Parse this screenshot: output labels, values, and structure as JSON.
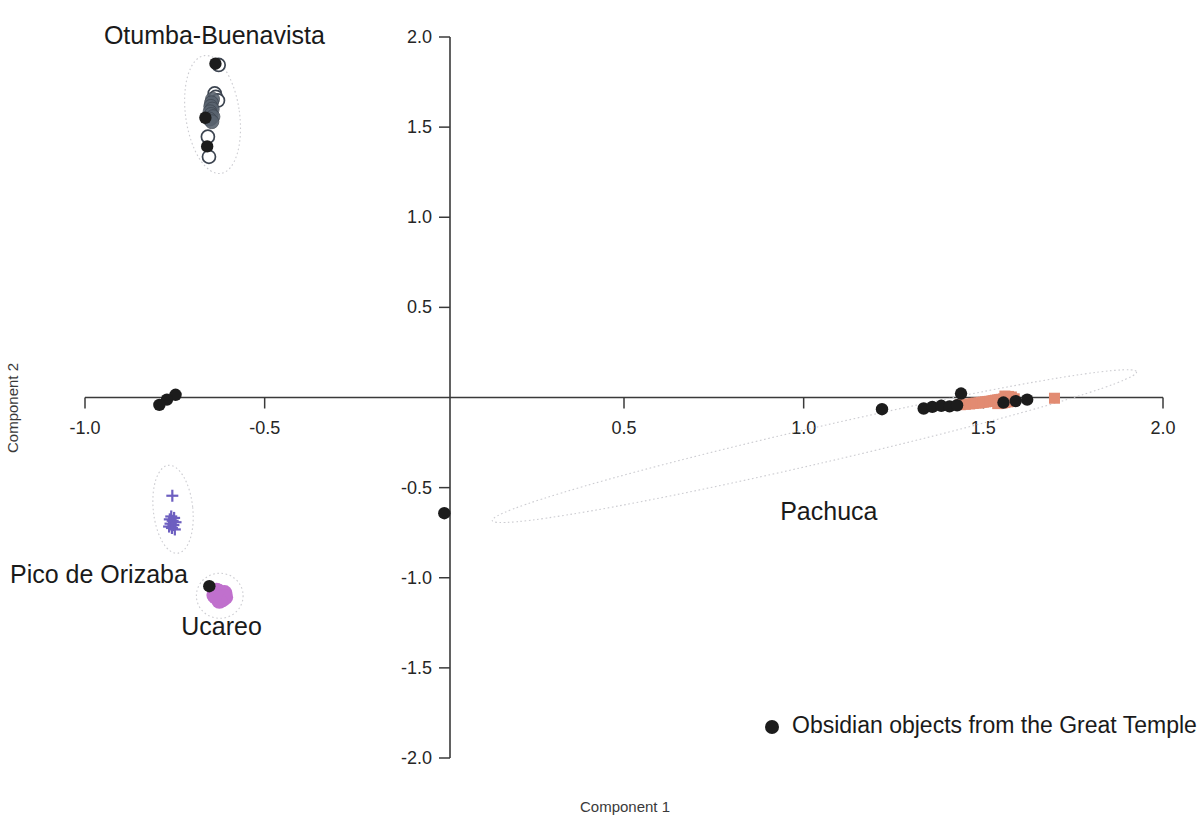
{
  "chart_data": {
    "type": "scatter",
    "title": "",
    "xlabel": "Component 1",
    "ylabel": "Component 2",
    "xlim": [
      -1.0,
      2.0
    ],
    "ylim": [
      -2.0,
      2.0
    ],
    "xticks": [
      "-1.0",
      "-0.5",
      "0.5",
      "1.0",
      "1.5",
      "2.0"
    ],
    "xtick_values": [
      -1.0,
      -0.5,
      0.5,
      1.0,
      1.5,
      2.0
    ],
    "yticks": [
      "2.0",
      "1.5",
      "1.0",
      "0.5",
      "-0.5",
      "-1.0",
      "-1.5",
      "-2.0"
    ],
    "ytick_values": [
      2.0,
      1.5,
      1.0,
      0.5,
      -0.5,
      -1.0,
      -1.5,
      -2.0
    ],
    "grid": false,
    "legend_position": "bottom-right",
    "legend": [
      {
        "marker": "filled-circle",
        "color": "#1c1c1c",
        "label": "Obsidian objects from the Great Temple"
      }
    ],
    "cluster_labels": [
      {
        "name": "Otumba-Buenavista",
        "x": -0.64,
        "y": 1.96
      },
      {
        "name": "Pachuca",
        "x": 1.07,
        "y": -0.68
      },
      {
        "name": "Pico de Orizaba",
        "x": -0.99,
        "y": -1.03
      },
      {
        "name": "Ucareo",
        "x": -0.62,
        "y": -1.32
      }
    ],
    "confidence_ellipses": [
      {
        "group": "Otumba-Buenavista",
        "cx": -0.645,
        "cy": 1.57,
        "rx": 0.075,
        "ry": 0.33,
        "angle": -8
      },
      {
        "group": "Pico de Orizaba",
        "cx": -0.755,
        "cy": -0.62,
        "rx": 0.055,
        "ry": 0.245,
        "angle": -6
      },
      {
        "group": "Ucareo",
        "cx": -0.625,
        "cy": -1.1,
        "rx": 0.065,
        "ry": 0.125,
        "angle": 0
      },
      {
        "group": "Pachuca",
        "cx": 1.03,
        "cy": -0.27,
        "rx": 0.92,
        "ry": 0.1,
        "angle": -13
      }
    ],
    "series": [
      {
        "name": "Otumba-Buenavista reference",
        "marker": "open-circle",
        "color": "#3c4450",
        "points": [
          {
            "x": -0.628,
            "y": 1.845
          },
          {
            "x": -0.639,
            "y": 1.687
          },
          {
            "x": -0.636,
            "y": 1.668
          },
          {
            "x": -0.63,
            "y": 1.648
          },
          {
            "x": -0.652,
            "y": 1.545
          },
          {
            "x": -0.658,
            "y": 1.447
          },
          {
            "x": -0.655,
            "y": 1.335
          }
        ]
      },
      {
        "name": "Otumba-Buenavista core",
        "marker": "filled-slate",
        "color": "#59636f",
        "points": [
          {
            "x": -0.645,
            "y": 1.655
          },
          {
            "x": -0.648,
            "y": 1.635
          },
          {
            "x": -0.65,
            "y": 1.615
          },
          {
            "x": -0.646,
            "y": 1.6
          },
          {
            "x": -0.652,
            "y": 1.585
          },
          {
            "x": -0.649,
            "y": 1.57
          },
          {
            "x": -0.644,
            "y": 1.558
          },
          {
            "x": -0.654,
            "y": 1.545
          },
          {
            "x": -0.647,
            "y": 1.53
          }
        ]
      },
      {
        "name": "Obsidian objects from the Great Temple",
        "marker": "filled-circle",
        "color": "#1c1c1c",
        "points": [
          {
            "x": -0.637,
            "y": 1.852
          },
          {
            "x": -0.665,
            "y": 1.552
          },
          {
            "x": -0.66,
            "y": 1.393
          },
          {
            "x": -0.748,
            "y": 0.015
          },
          {
            "x": -0.772,
            "y": -0.012
          },
          {
            "x": -0.793,
            "y": -0.041
          },
          {
            "x": -0.654,
            "y": -1.047
          },
          {
            "x": 0.0,
            "y": -0.642
          },
          {
            "x": 1.218,
            "y": -0.065
          },
          {
            "x": 1.334,
            "y": -0.061
          },
          {
            "x": 1.358,
            "y": -0.052
          },
          {
            "x": 1.383,
            "y": -0.046
          },
          {
            "x": 1.406,
            "y": -0.049
          },
          {
            "x": 1.427,
            "y": -0.043
          },
          {
            "x": 1.438,
            "y": 0.022
          },
          {
            "x": 1.556,
            "y": -0.028
          },
          {
            "x": 1.59,
            "y": -0.02
          },
          {
            "x": 1.622,
            "y": -0.012
          }
        ]
      },
      {
        "name": "Pachuca reference",
        "marker": "filled-square",
        "color": "#e28b72",
        "points": [
          {
            "x": 1.436,
            "y": -0.04
          },
          {
            "x": 1.45,
            "y": -0.038
          },
          {
            "x": 1.462,
            "y": -0.036
          },
          {
            "x": 1.472,
            "y": -0.033
          },
          {
            "x": 1.48,
            "y": -0.031
          },
          {
            "x": 1.488,
            "y": -0.03
          },
          {
            "x": 1.494,
            "y": -0.027
          },
          {
            "x": 1.5,
            "y": -0.026
          },
          {
            "x": 1.506,
            "y": -0.024
          },
          {
            "x": 1.512,
            "y": -0.022
          },
          {
            "x": 1.518,
            "y": -0.021
          },
          {
            "x": 1.524,
            "y": -0.019
          },
          {
            "x": 1.529,
            "y": -0.017
          },
          {
            "x": 1.534,
            "y": -0.015
          },
          {
            "x": 1.54,
            "y": -0.013
          },
          {
            "x": 1.545,
            "y": -0.012
          },
          {
            "x": 1.55,
            "y": -0.01
          },
          {
            "x": 1.556,
            "y": -0.008
          },
          {
            "x": 1.561,
            "y": -0.006
          },
          {
            "x": 1.566,
            "y": -0.004
          },
          {
            "x": 1.572,
            "y": -0.002
          },
          {
            "x": 1.54,
            "y": -0.034
          },
          {
            "x": 1.552,
            "y": -0.031
          },
          {
            "x": 1.56,
            "y": -0.028
          },
          {
            "x": 1.568,
            "y": -0.024
          },
          {
            "x": 1.575,
            "y": -0.019
          },
          {
            "x": 1.58,
            "y": -0.013
          },
          {
            "x": 1.586,
            "y": -0.007
          },
          {
            "x": 1.56,
            "y": 0.008
          },
          {
            "x": 1.57,
            "y": 0.006
          },
          {
            "x": 1.578,
            "y": 0.003
          },
          {
            "x": 1.698,
            "y": -0.004
          }
        ]
      },
      {
        "name": "Pico de Orizaba reference",
        "marker": "plus",
        "color": "#6d5fc0",
        "points": [
          {
            "x": -0.757,
            "y": -0.545
          },
          {
            "x": -0.76,
            "y": -0.66
          },
          {
            "x": -0.752,
            "y": -0.668
          },
          {
            "x": -0.764,
            "y": -0.676
          },
          {
            "x": -0.756,
            "y": -0.684
          },
          {
            "x": -0.748,
            "y": -0.692
          },
          {
            "x": -0.762,
            "y": -0.7
          },
          {
            "x": -0.754,
            "y": -0.708
          },
          {
            "x": -0.766,
            "y": -0.716
          },
          {
            "x": -0.758,
            "y": -0.724
          },
          {
            "x": -0.75,
            "y": -0.732
          }
        ]
      },
      {
        "name": "Ucareo reference",
        "marker": "filled-circle-orchid",
        "color": "#c070cd",
        "points": [
          {
            "x": -0.63,
            "y": -1.09
          },
          {
            "x": -0.62,
            "y": -1.095
          },
          {
            "x": -0.612,
            "y": -1.085
          },
          {
            "x": -0.636,
            "y": -1.105
          },
          {
            "x": -0.624,
            "y": -1.112
          },
          {
            "x": -0.616,
            "y": -1.1
          },
          {
            "x": -0.628,
            "y": -1.078
          },
          {
            "x": -0.618,
            "y": -1.12
          },
          {
            "x": -0.634,
            "y": -1.072
          },
          {
            "x": -0.61,
            "y": -1.108
          },
          {
            "x": -0.626,
            "y": -1.128
          },
          {
            "x": -0.64,
            "y": -1.096
          }
        ]
      }
    ]
  }
}
